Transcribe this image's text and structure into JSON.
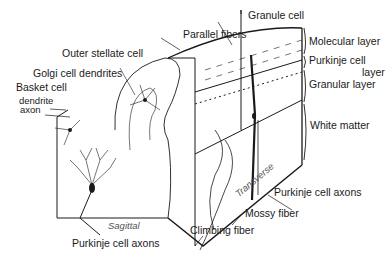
{
  "diagram": {
    "labels": {
      "granule_cell": "Granule cell",
      "parallel_fibers": "Parallel fibers",
      "outer_stellate_cell": "Outer stellate cell",
      "golgi_cell_dendrites": "Golgi cell dendrites",
      "basket_cell": "Basket cell",
      "dendrite": "dendrite",
      "axon": "axon",
      "molecular_layer": "Molecular layer",
      "purkinje_cell_layer_line1": "Purkinje cell",
      "purkinje_cell_layer_line2": "layer",
      "granular_layer": "Granular layer",
      "white_matter": "White matter",
      "transverse": "Transverse",
      "purkinje_cell_axons_right": "Purkinje cell axons",
      "mossy_fiber": "Mossy fiber",
      "climbing_fiber": "Climbing fiber",
      "sagittal": "Sagittal",
      "purkinje_cell_axons_bottom": "Purkinje cell axons"
    },
    "colors": {
      "ink": "#1a1a1a",
      "background": "#ffffff",
      "plane_label": "#555555"
    }
  }
}
